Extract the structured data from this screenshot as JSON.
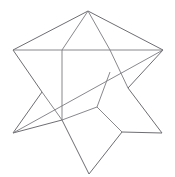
{
  "figure": {
    "type": "line-drawing",
    "background_color": "#ffffff",
    "stroke_color": "#6e6e73",
    "stroke_width": 1,
    "canvas": {
      "width": 175,
      "height": 177
    },
    "points": {
      "top_apex": [
        88,
        11
      ],
      "upper_left_point": [
        13,
        50
      ],
      "upper_right_point": [
        163,
        50
      ],
      "lower_left_point": [
        13,
        133
      ],
      "lower_right_point": [
        162,
        133
      ],
      "bottom_apex": [
        89,
        174
      ],
      "left_notch": [
        42,
        92
      ],
      "right_notch": [
        128,
        88
      ],
      "inner_top_left": [
        62,
        50
      ],
      "inner_top_right": [
        110,
        50
      ],
      "inner_bottom_left": [
        62,
        120
      ],
      "inner_bottom_mid": [
        97,
        107
      ],
      "inner_bottom_right": [
        122,
        132
      ]
    },
    "paths": [
      {
        "name": "star-outline-upper",
        "d": "M 13,50 L 88,11 L 163,50",
        "description": "left point to top apex to right point"
      },
      {
        "name": "star-outline-left-notch",
        "d": "M 13,50 L 42,92 L 13,133",
        "description": "left point down through left notch to lower-left point"
      },
      {
        "name": "star-outline-lower",
        "d": "M 13,133 L 62,120 L 89,174 L 122,132 L 162,133",
        "description": "lower-left to bottom apex to lower-right point"
      },
      {
        "name": "star-outline-right-notch",
        "d": "M 163,50 L 128,88 L 162,133",
        "description": "right point down through right notch to lower-right point"
      },
      {
        "name": "long-horizontal-chord",
        "d": "M 13,50 L 163,50",
        "description": "long chord across the upper star from left point to right point"
      },
      {
        "name": "long-diagonal-chord",
        "d": "M 13,133 L 163,50",
        "description": "long diagonal from lower-left point to upper-right point"
      },
      {
        "name": "inner-left-vertical",
        "d": "M 62,50 L 62,120",
        "description": "inner near-vertical edge on left of inner polygon"
      },
      {
        "name": "inner-top-left-arm",
        "d": "M 62,50 L 88,11",
        "description": "upper arm left edge continuing into inner polygon"
      },
      {
        "name": "inner-top-right-arm",
        "d": "M 110,50 L 88,11",
        "description": "upper arm right edge continuing into inner polygon"
      },
      {
        "name": "inner-right-vertical",
        "d": "M 110,50 L 128,88",
        "description": "inner edge from top-right inner vertex to right notch"
      },
      {
        "name": "inner-mid-diagonal",
        "d": "M 97,107 L 122,132",
        "description": "inner edge from mid-bottom vertex down-right"
      },
      {
        "name": "inner-mid-up",
        "d": "M 97,107 L 110,72",
        "description": "inner edge from mid-bottom vertex up toward diagonal chord"
      },
      {
        "name": "inner-bottom-chord",
        "d": "M 62,120 L 97,107",
        "description": "inner edge connecting lower-left inner vertex to mid vertex"
      },
      {
        "name": "left-notch-to-diagonal",
        "d": "M 42,92 L 62,120",
        "description": "short edge linking left notch region to lower inner vertex"
      }
    ]
  }
}
